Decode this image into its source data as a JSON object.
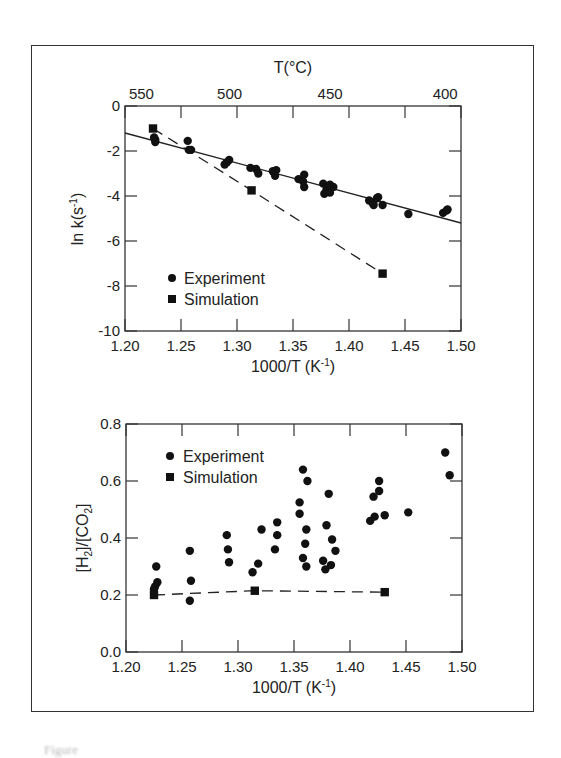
{
  "chart_data": [
    {
      "type": "scatter",
      "title": "",
      "xlabel": "1000/T (K⁻¹)",
      "ylabel": "ln k(s⁻¹)",
      "secondary_xlabel": "T(°C)",
      "xlim": [
        1.2,
        1.5
      ],
      "ylim": [
        -10,
        0
      ],
      "xticks": [
        "1.20",
        "1.25",
        "1.30",
        "1.35",
        "1.40",
        "1.45",
        "1.50"
      ],
      "yticks": [
        "0",
        "-2",
        "-4",
        "-6",
        "-8",
        "-10"
      ],
      "secondary_xticks": [
        {
          "label": "550",
          "x": 1.2147
        },
        {
          "label": "500",
          "x": 1.2934
        },
        {
          "label": "450",
          "x": 1.3831
        },
        {
          "label": "400",
          "x": 1.4859
        }
      ],
      "grid": false,
      "legend": {
        "position": "lower-left",
        "entries": [
          "Experiment",
          "Simulation"
        ]
      },
      "series": [
        {
          "name": "Experiment",
          "marker": "circle",
          "points": [
            [
              1.226,
              -1.4
            ],
            [
              1.227,
              -1.5
            ],
            [
              1.227,
              -1.6
            ],
            [
              1.256,
              -1.55
            ],
            [
              1.257,
              -1.95
            ],
            [
              1.259,
              -1.95
            ],
            [
              1.289,
              -2.6
            ],
            [
              1.291,
              -2.5
            ],
            [
              1.293,
              -2.4
            ],
            [
              1.312,
              -2.75
            ],
            [
              1.317,
              -2.8
            ],
            [
              1.319,
              -3.0
            ],
            [
              1.332,
              -2.9
            ],
            [
              1.334,
              -3.1
            ],
            [
              1.335,
              -2.85
            ],
            [
              1.355,
              -3.25
            ],
            [
              1.359,
              -3.35
            ],
            [
              1.36,
              -3.05
            ],
            [
              1.36,
              -3.6
            ],
            [
              1.377,
              -3.45
            ],
            [
              1.378,
              -3.9
            ],
            [
              1.38,
              -3.7
            ],
            [
              1.381,
              -3.6
            ],
            [
              1.383,
              -3.85
            ],
            [
              1.383,
              -3.5
            ],
            [
              1.386,
              -3.6
            ],
            [
              1.418,
              -4.2
            ],
            [
              1.421,
              -4.3
            ],
            [
              1.422,
              -4.4
            ],
            [
              1.425,
              -4.1
            ],
            [
              1.426,
              -4.05
            ],
            [
              1.43,
              -4.4
            ],
            [
              1.453,
              -4.8
            ],
            [
              1.484,
              -4.75
            ],
            [
              1.487,
              -4.65
            ],
            [
              1.488,
              -4.6
            ]
          ]
        },
        {
          "name": "Simulation",
          "marker": "square",
          "line": "dashed",
          "points": [
            [
              1.225,
              -1.0
            ],
            [
              1.313,
              -3.75
            ],
            [
              1.43,
              -7.45
            ]
          ]
        },
        {
          "name": "Experiment fit",
          "marker": "none",
          "line": "solid",
          "points": [
            [
              1.2,
              -1.2
            ],
            [
              1.5,
              -5.2
            ]
          ]
        }
      ]
    },
    {
      "type": "scatter",
      "title": "",
      "xlabel": "1000/T (K⁻¹)",
      "ylabel": "[H₂]/[CO₂]",
      "xlim": [
        1.2,
        1.5
      ],
      "ylim": [
        0.0,
        0.8
      ],
      "xticks": [
        "1.20",
        "1.25",
        "1.30",
        "1.35",
        "1.40",
        "1.45",
        "1.50"
      ],
      "yticks": [
        "0.0",
        "0.2",
        "0.4",
        "0.6",
        "0.8"
      ],
      "grid": false,
      "legend": {
        "position": "upper-left",
        "entries": [
          "Experiment",
          "Simulation"
        ]
      },
      "series": [
        {
          "name": "Experiment",
          "marker": "circle",
          "points": [
            [
              1.225,
              0.22
            ],
            [
              1.227,
              0.3
            ],
            [
              1.228,
              0.245
            ],
            [
              1.226,
              0.23
            ],
            [
              1.257,
              0.355
            ],
            [
              1.258,
              0.25
            ],
            [
              1.257,
              0.18
            ],
            [
              1.29,
              0.41
            ],
            [
              1.291,
              0.36
            ],
            [
              1.292,
              0.315
            ],
            [
              1.313,
              0.28
            ],
            [
              1.318,
              0.31
            ],
            [
              1.321,
              0.43
            ],
            [
              1.333,
              0.36
            ],
            [
              1.335,
              0.41
            ],
            [
              1.335,
              0.455
            ],
            [
              1.355,
              0.525
            ],
            [
              1.355,
              0.485
            ],
            [
              1.358,
              0.64
            ],
            [
              1.358,
              0.33
            ],
            [
              1.36,
              0.38
            ],
            [
              1.361,
              0.43
            ],
            [
              1.361,
              0.3
            ],
            [
              1.362,
              0.6
            ],
            [
              1.376,
              0.32
            ],
            [
              1.378,
              0.29
            ],
            [
              1.379,
              0.445
            ],
            [
              1.381,
              0.555
            ],
            [
              1.383,
              0.305
            ],
            [
              1.384,
              0.395
            ],
            [
              1.387,
              0.355
            ],
            [
              1.418,
              0.46
            ],
            [
              1.421,
              0.545
            ],
            [
              1.422,
              0.475
            ],
            [
              1.426,
              0.565
            ],
            [
              1.426,
              0.6
            ],
            [
              1.431,
              0.48
            ],
            [
              1.452,
              0.49
            ],
            [
              1.485,
              0.7
            ],
            [
              1.489,
              0.62
            ]
          ]
        },
        {
          "name": "Simulation",
          "marker": "square",
          "line": "dashed",
          "points": [
            [
              1.225,
              0.2
            ],
            [
              1.315,
              0.215
            ],
            [
              1.431,
              0.21
            ]
          ]
        }
      ]
    }
  ],
  "top_chart": {
    "secondary_axis_title": "T(°C)",
    "secondary_ticks": [
      "550",
      "500",
      "450",
      "400"
    ],
    "y_axis_title": "ln k(s⁻¹)",
    "x_axis_title": "1000/T (K⁻¹)",
    "y_ticks": [
      "0",
      "-2",
      "-4",
      "-6",
      "-8",
      "-10"
    ],
    "x_ticks": [
      "1.20",
      "1.25",
      "1.30",
      "1.35",
      "1.40",
      "1.45",
      "1.50"
    ],
    "legend": {
      "experiment": "Experiment",
      "simulation": "Simulation"
    }
  },
  "bottom_chart": {
    "y_axis_title": "[H₂]/[CO₂]",
    "x_axis_title": "1000/T (K⁻¹)",
    "y_ticks": [
      "0.0",
      "0.2",
      "0.4",
      "0.6",
      "0.8"
    ],
    "x_ticks": [
      "1.20",
      "1.25",
      "1.30",
      "1.35",
      "1.40",
      "1.45",
      "1.50"
    ],
    "legend": {
      "experiment": "Experiment",
      "simulation": "Simulation"
    }
  },
  "caption": {
    "text": "Figure"
  }
}
